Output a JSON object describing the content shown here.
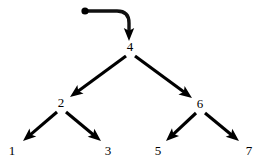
{
  "diagram": {
    "type": "tree",
    "background_color": "#ffffff",
    "ink_color": "#000000",
    "root_pointer": {
      "name": "root-pointer",
      "dot": {
        "x": 85,
        "y": 11,
        "r": 3.6
      },
      "path": "M 85 11 L 117 11 Q 129 11 129 23 L 129 31",
      "arrow": {
        "x": 129,
        "y": 41,
        "dir": "down"
      }
    },
    "nodes": [
      {
        "id": "n4",
        "label": "4",
        "x": 130,
        "y": 51,
        "level": 0,
        "role": "root"
      },
      {
        "id": "n2",
        "label": "2",
        "x": 61,
        "y": 107,
        "level": 1,
        "role": "internal"
      },
      {
        "id": "n6",
        "label": "6",
        "x": 200,
        "y": 108,
        "level": 1,
        "role": "internal"
      },
      {
        "id": "n1",
        "label": "1",
        "x": 12,
        "y": 155,
        "level": 2,
        "role": "leaf"
      },
      {
        "id": "n3",
        "label": "3",
        "x": 108,
        "y": 155,
        "level": 2,
        "role": "leaf"
      },
      {
        "id": "n5",
        "label": "5",
        "x": 158,
        "y": 155,
        "level": 2,
        "role": "leaf"
      },
      {
        "id": "n7",
        "label": "7",
        "x": 249,
        "y": 155,
        "level": 2,
        "role": "leaf"
      }
    ],
    "edges": [
      {
        "id": "e4-2",
        "from": "4",
        "to": "2",
        "x1": 126,
        "y1": 56,
        "x2": 70,
        "y2": 97,
        "side": "left"
      },
      {
        "id": "e4-6",
        "from": "4",
        "to": "6",
        "x1": 135,
        "y1": 56,
        "x2": 192,
        "y2": 98,
        "side": "right"
      },
      {
        "id": "e2-1",
        "from": "2",
        "to": "1",
        "x1": 57,
        "y1": 112,
        "x2": 23,
        "y2": 141,
        "side": "left"
      },
      {
        "id": "e2-3",
        "from": "2",
        "to": "3",
        "x1": 66,
        "y1": 112,
        "x2": 101,
        "y2": 141,
        "side": "right"
      },
      {
        "id": "e6-5",
        "from": "6",
        "to": "5",
        "x1": 196,
        "y1": 113,
        "x2": 166,
        "y2": 141,
        "side": "left"
      },
      {
        "id": "e6-7",
        "from": "6",
        "to": "7",
        "x1": 205,
        "y1": 113,
        "x2": 239,
        "y2": 141,
        "side": "right"
      }
    ]
  }
}
